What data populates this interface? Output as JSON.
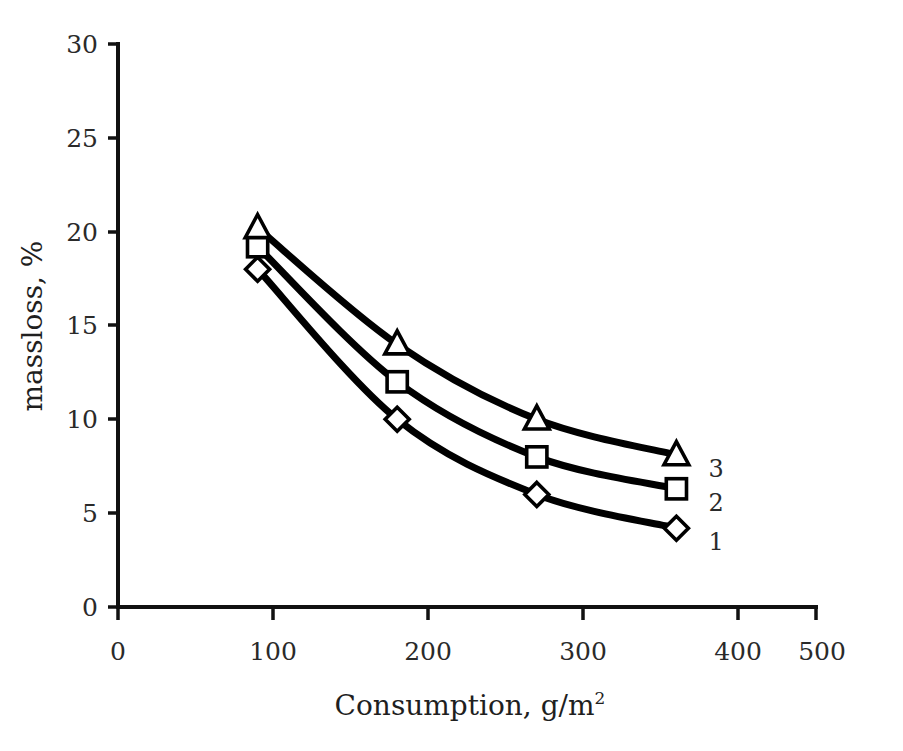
{
  "chart_data": {
    "type": "line",
    "title": "",
    "xlabel": "Consumption, g/m2",
    "xlabel_base": "Consumption, g/m",
    "xlabel_exponent": "2",
    "ylabel": "massloss, %",
    "xlim": [
      0,
      500
    ],
    "ylim": [
      0,
      30
    ],
    "xticks": [
      0,
      100,
      200,
      300,
      400,
      500
    ],
    "xtick_labels": [
      "0",
      "100",
      "200",
      "300",
      "400",
      "500"
    ],
    "yticks": [
      0,
      5,
      10,
      15,
      20,
      25,
      30
    ],
    "ytick_labels": [
      "0",
      "5",
      "10",
      "15",
      "20",
      "25",
      "30"
    ],
    "grid": false,
    "legend_position": "right-inline-end-labels",
    "x": [
      100,
      200,
      300,
      400
    ],
    "series": [
      {
        "name": "1",
        "label": "1",
        "marker": "diamond",
        "color": "#000000",
        "values": [
          18.0,
          10.0,
          6.0,
          4.2
        ]
      },
      {
        "name": "2",
        "label": "2",
        "marker": "square",
        "color": "#000000",
        "values": [
          19.2,
          12.0,
          8.0,
          6.3
        ]
      },
      {
        "name": "3",
        "label": "3",
        "marker": "triangle",
        "color": "#000000",
        "values": [
          20.2,
          14.0,
          10.0,
          8.1
        ]
      }
    ]
  },
  "figure": {
    "background_color": "#ffffff",
    "line_color": "#000000",
    "marker_fill": "#ffffff",
    "axis_color": "#111111"
  }
}
